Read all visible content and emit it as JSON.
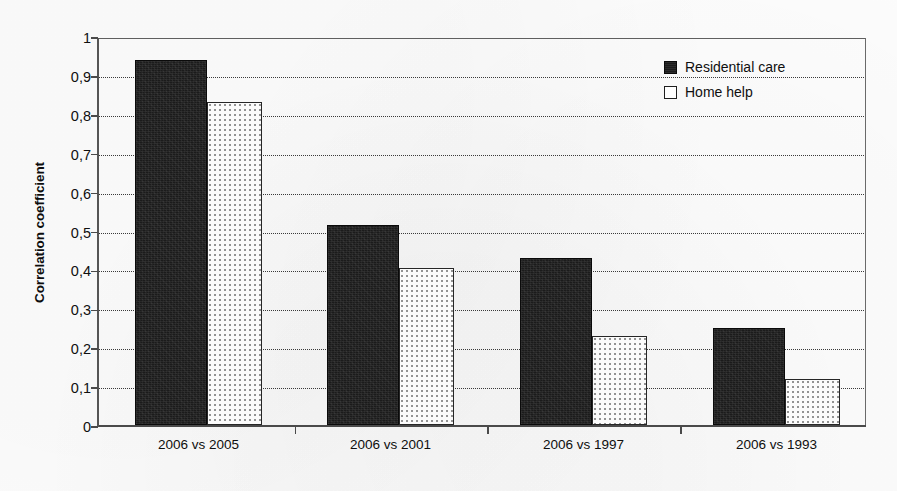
{
  "chart_data": {
    "type": "bar",
    "title": "",
    "xlabel": "",
    "ylabel": "Correlation coefficient",
    "ylim": [
      0,
      1
    ],
    "grid": true,
    "legend_position": "top-right",
    "categories": [
      "2006 vs 2005",
      "2006 vs 2001",
      "2006 vs 1997",
      "2006 vs 1993"
    ],
    "series": [
      {
        "name": "Residential care",
        "values": [
          0.94,
          0.515,
          0.43,
          0.25
        ],
        "color": "#1b1b1b",
        "pattern": "solid-dark"
      },
      {
        "name": "Home help",
        "values": [
          0.83,
          0.405,
          0.23,
          0.12
        ],
        "color": "#ffffff",
        "pattern": "dotted-light"
      }
    ],
    "y_ticks": [
      {
        "value": 0,
        "label": "0"
      },
      {
        "value": 0.1,
        "label": "0,1"
      },
      {
        "value": 0.2,
        "label": "0,2"
      },
      {
        "value": 0.3,
        "label": "0,3"
      },
      {
        "value": 0.4,
        "label": "0,4"
      },
      {
        "value": 0.5,
        "label": "0,5"
      },
      {
        "value": 0.6,
        "label": "0,6"
      },
      {
        "value": 0.7,
        "label": "0,7"
      },
      {
        "value": 0.8,
        "label": "0,8"
      },
      {
        "value": 0.9,
        "label": "0,9"
      },
      {
        "value": 1,
        "label": "1"
      }
    ]
  },
  "legend": {
    "items": [
      {
        "label": "Residential care",
        "swatch": "filled-dark-square-icon"
      },
      {
        "label": "Home help",
        "swatch": "outlined-white-square-icon"
      }
    ]
  }
}
